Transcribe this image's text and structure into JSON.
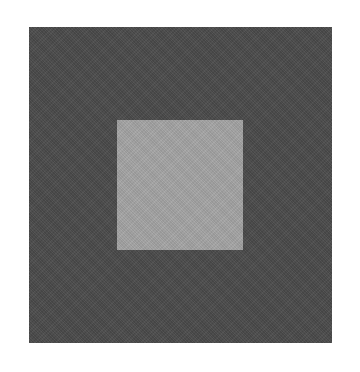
{
  "figure": {
    "background_color": "#ffffff",
    "outer_square": {
      "color": "#4a4a4a"
    },
    "inner_square": {
      "color": "#a2a2a2"
    }
  }
}
